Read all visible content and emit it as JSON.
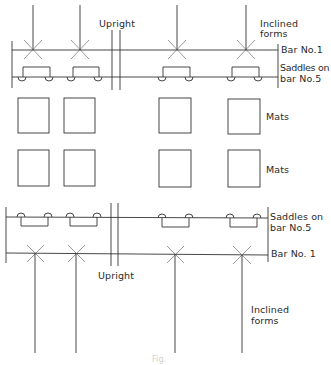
{
  "diagram": {
    "type": "technical-drawing",
    "colors": {
      "line": "#333333",
      "background": "#ffffff"
    },
    "top_assembly": {
      "labels": {
        "upright": "Upright",
        "inclined_forms_1": "Inclined",
        "inclined_forms_2": "forms",
        "bar_no1": "Bar No.1",
        "saddles_1": "Saddles on",
        "saddles_2": "bar No.5"
      }
    },
    "mats": {
      "row1_label": "Mats",
      "row2_label": "Mats"
    },
    "bottom_assembly": {
      "labels": {
        "saddles_1": "Saddles on",
        "saddles_2": "bar No.5",
        "bar_no1": "Bar No. 1",
        "upright": "Upright",
        "inclined_forms_1": "Inclined",
        "inclined_forms_2": "forms"
      }
    },
    "caption": "Fig."
  }
}
